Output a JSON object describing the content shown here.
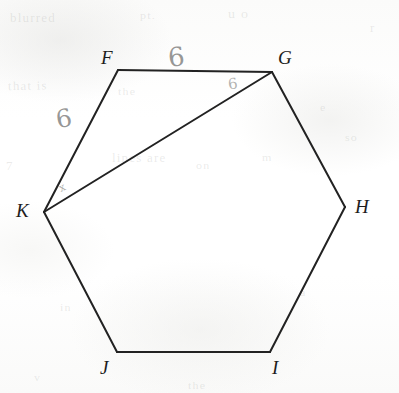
{
  "figure": {
    "shape_name": "hexagon",
    "stroke_color": "#222222",
    "background_color": "#fdfdfc",
    "pencil_color": "#80807e"
  },
  "vertices": [
    {
      "id": "F",
      "label": "F",
      "x": 118,
      "y": 70,
      "label_x": 101,
      "label_y": 48
    },
    {
      "id": "G",
      "label": "G",
      "x": 272,
      "y": 72,
      "label_x": 278,
      "label_y": 48
    },
    {
      "id": "H",
      "label": "H",
      "x": 345,
      "y": 207,
      "label_x": 355,
      "label_y": 197
    },
    {
      "id": "I",
      "label": "I",
      "x": 270,
      "y": 352,
      "label_x": 272,
      "label_y": 358
    },
    {
      "id": "J",
      "label": "J",
      "x": 117,
      "y": 352,
      "label_x": 100,
      "label_y": 358
    },
    {
      "id": "K",
      "label": "K",
      "x": 44,
      "y": 212,
      "label_x": 16,
      "label_y": 201
    }
  ],
  "edges": [
    {
      "id": "FG",
      "from": "F",
      "to": "G",
      "kind": "side"
    },
    {
      "id": "GH",
      "from": "G",
      "to": "H",
      "kind": "side"
    },
    {
      "id": "HI",
      "from": "H",
      "to": "I",
      "kind": "side"
    },
    {
      "id": "IJ",
      "from": "I",
      "to": "J",
      "kind": "side"
    },
    {
      "id": "JK",
      "from": "J",
      "to": "K",
      "kind": "side"
    },
    {
      "id": "KF",
      "from": "K",
      "to": "F",
      "kind": "side"
    },
    {
      "id": "KG",
      "from": "K",
      "to": "G",
      "kind": "diagonal"
    }
  ],
  "measure_labels": [
    {
      "id": "len-fg",
      "for_edge": "FG",
      "text": "6",
      "x": 168,
      "y": 44
    },
    {
      "id": "len-fk",
      "for_edge": "KF",
      "text": "6",
      "x": 56,
      "y": 106
    },
    {
      "id": "len-kg",
      "for_edge": "KG",
      "text": "6",
      "x": 228,
      "y": 77
    }
  ],
  "angle_marks": [
    {
      "id": "angle-at-k",
      "at_vertex": "K",
      "text": "x",
      "x": 59,
      "y": 182
    }
  ],
  "background_ghost_text": [
    {
      "text": "blurred",
      "x": 10,
      "y": 10,
      "size": 13,
      "rotate": 0
    },
    {
      "text": "u o",
      "x": 228,
      "y": 6,
      "size": 14,
      "rotate": 0
    },
    {
      "text": "pt.",
      "x": 140,
      "y": 8,
      "size": 12,
      "rotate": 0
    },
    {
      "text": "that is",
      "x": 8,
      "y": 78,
      "size": 13,
      "rotate": -1
    },
    {
      "text": "the",
      "x": 118,
      "y": 84,
      "size": 12,
      "rotate": 0
    },
    {
      "text": "r",
      "x": 370,
      "y": 20,
      "size": 13,
      "rotate": 0
    },
    {
      "text": "lines are",
      "x": 112,
      "y": 150,
      "size": 13,
      "rotate": 0
    },
    {
      "text": "e",
      "x": 320,
      "y": 100,
      "size": 12,
      "rotate": 0
    },
    {
      "text": "so",
      "x": 345,
      "y": 130,
      "size": 12,
      "rotate": 0
    },
    {
      "text": "7",
      "x": 6,
      "y": 158,
      "size": 13,
      "rotate": 0
    },
    {
      "text": "on",
      "x": 196,
      "y": 158,
      "size": 12,
      "rotate": 0
    },
    {
      "text": "m",
      "x": 262,
      "y": 150,
      "size": 12,
      "rotate": 0
    },
    {
      "text": "in",
      "x": 60,
      "y": 300,
      "size": 12,
      "rotate": 0
    },
    {
      "text": "a",
      "x": 300,
      "y": 285,
      "size": 12,
      "rotate": 0
    },
    {
      "text": "the",
      "x": 188,
      "y": 378,
      "size": 12,
      "rotate": 0
    },
    {
      "text": "v",
      "x": 34,
      "y": 370,
      "size": 12,
      "rotate": 0
    }
  ]
}
